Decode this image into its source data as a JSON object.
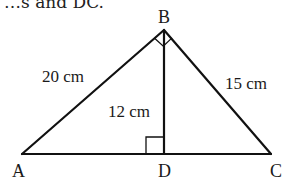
{
  "header": {
    "cutoff_text": "…s and DC."
  },
  "diagram": {
    "vertices": {
      "A": {
        "label": "A",
        "x": 22,
        "y": 154
      },
      "B": {
        "label": "B",
        "x": 164,
        "y": 30
      },
      "C": {
        "label": "C",
        "x": 271,
        "y": 154
      },
      "D": {
        "label": "D",
        "x": 164,
        "y": 154
      }
    },
    "segments": [
      {
        "from": "A",
        "to": "B",
        "length_label": "20 cm"
      },
      {
        "from": "B",
        "to": "C",
        "length_label": "15 cm"
      },
      {
        "from": "B",
        "to": "D",
        "length_label": "12 cm"
      },
      {
        "from": "A",
        "to": "C",
        "length_label": ""
      }
    ],
    "right_angles": [
      "B",
      "D"
    ],
    "labels": {
      "AB": "20 cm",
      "BC": "15 cm",
      "BD": "12 cm"
    },
    "stroke_color": "#111111"
  }
}
